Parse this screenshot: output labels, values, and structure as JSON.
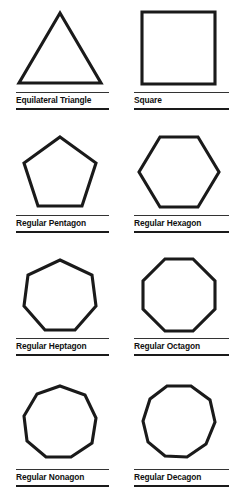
{
  "page": {
    "background_color": "#ffffff",
    "stroke_color": "#1a1a1a",
    "columns": 2,
    "rows": 4
  },
  "figures": [
    {
      "label": "Equilateral Triangle",
      "sides": 3,
      "orientation": "point-up",
      "icon_name": "triangle-shape"
    },
    {
      "label": "Square",
      "sides": 4,
      "orientation": "flat-top",
      "icon_name": "square-shape"
    },
    {
      "label": "Regular Pentagon",
      "sides": 5,
      "orientation": "point-up",
      "icon_name": "pentagon-shape"
    },
    {
      "label": "Regular Hexagon",
      "sides": 6,
      "orientation": "flat-top",
      "icon_name": "hexagon-shape"
    },
    {
      "label": "Regular Heptagon",
      "sides": 7,
      "orientation": "point-up",
      "icon_name": "heptagon-shape"
    },
    {
      "label": "Regular Octagon",
      "sides": 8,
      "orientation": "flat-top",
      "icon_name": "octagon-shape"
    },
    {
      "label": "Regular Nonagon",
      "sides": 9,
      "orientation": "point-up",
      "icon_name": "nonagon-shape"
    },
    {
      "label": "Regular Decagon",
      "sides": 10,
      "orientation": "flat-top",
      "icon_name": "decagon-shape"
    }
  ]
}
